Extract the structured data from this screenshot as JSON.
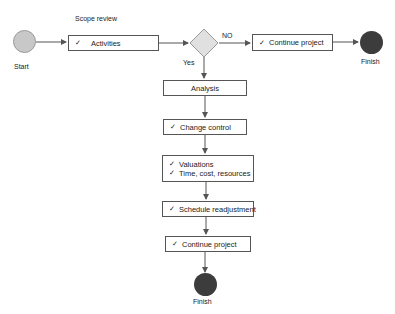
{
  "diagram": {
    "title_fragment": "",
    "colors": {
      "start_fill": "#c8c8c8",
      "finish_fill": "#3c3c3c",
      "decision_fill": "#e0e0e0",
      "stroke": "#555555"
    },
    "top_flow": {
      "start_label": "Start",
      "scope_label": "Scope review",
      "activities": {
        "check": "✓",
        "text": "Activities"
      },
      "decision": {
        "no_label": "NO",
        "yes_label": "Yes"
      },
      "continue": {
        "check": "✓",
        "text": "Continue project"
      },
      "finish_label": "Finish"
    },
    "vertical_flow": {
      "analysis": "Analysis",
      "change_control": {
        "check": "✓",
        "text": "Change control"
      },
      "valuations": {
        "lines": [
          {
            "check": "✓",
            "text": "Valuations"
          },
          {
            "check": "✓",
            "text": "Time, cost, resources"
          }
        ]
      },
      "schedule": {
        "check": "✓",
        "text": "Schedule readjustment"
      },
      "continue": {
        "check": "✓",
        "text": "Continue project"
      },
      "finish_label": "Finish"
    }
  }
}
